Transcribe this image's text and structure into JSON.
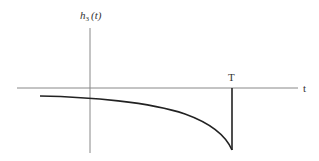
{
  "diagram": {
    "y_axis_label": "h",
    "y_axis_label_sub": "3",
    "y_axis_label_arg": "(t)",
    "x_axis_label": "t",
    "marker_label": "T",
    "colors": {
      "axis": "#888888",
      "curve": "#222222",
      "text": "#333333"
    }
  }
}
